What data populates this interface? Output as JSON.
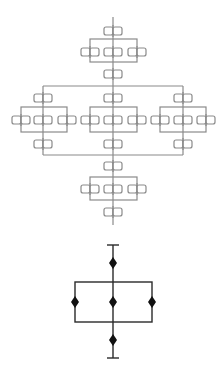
{
  "diagram": {
    "title": "",
    "colors": {
      "background": "#ffffff",
      "upper_lines": "#8a8a8a",
      "lower_lines": "#2a2a2a",
      "lower_nodes": "#111111"
    },
    "upper_reliability_block_diagram": {
      "spine_x": 113,
      "series_top": {
        "box_top_y": 27,
        "parallel_group": {
          "rect": [
            90,
            39,
            137,
            62
          ],
          "box_row_y": 48,
          "box_xs": [
            90,
            113,
            137
          ]
        },
        "box_bottom_y": 70
      },
      "three_branch_parallel": {
        "top_bus_y": 86,
        "bottom_bus_y": 155,
        "branches": [
          {
            "x": 43,
            "top_box_y": 94,
            "group_rect": [
              21,
              107,
              67,
              132
            ],
            "box_xs": [
              21,
              43,
              67
            ],
            "box_row_y": 116,
            "bottom_box_y": 140
          },
          {
            "x": 113,
            "top_box_y": 94,
            "group_rect": [
              90,
              107,
              137,
              132
            ],
            "box_xs": [
              90,
              113,
              137
            ],
            "box_row_y": 116,
            "bottom_box_y": 140
          },
          {
            "x": 183,
            "top_box_y": 94,
            "group_rect": [
              160,
              107,
              206,
              132
            ],
            "box_xs": [
              160,
              183,
              206
            ],
            "box_row_y": 116,
            "bottom_box_y": 140
          }
        ]
      },
      "series_bottom": {
        "box_top_y": 162,
        "parallel_group": {
          "rect": [
            90,
            177,
            137,
            200
          ],
          "box_row_y": 185,
          "box_xs": [
            90,
            113,
            137
          ]
        },
        "box_bottom_y": 208
      }
    },
    "lower_simplified_diagram": {
      "spine_x": 113,
      "top_terminal_y": 245,
      "top_node_y": 263,
      "parallel_rect": [
        75,
        282,
        152,
        322
      ],
      "middle_node_y": 302,
      "middle_node_xs": [
        75,
        113,
        152
      ],
      "bottom_node_y": 340,
      "bottom_terminal_y": 358
    }
  }
}
